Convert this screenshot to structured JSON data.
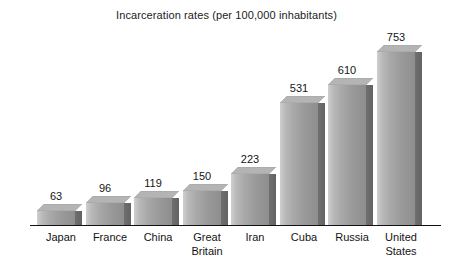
{
  "chart_data": {
    "type": "bar",
    "title": "Incarceration rates (per 100,000 inhabitants)",
    "xlabel": "",
    "ylabel": "",
    "ylim": [
      0,
      800
    ],
    "grid": false,
    "legend": "none",
    "value_labels": true,
    "style": "3d-grayscale-bars",
    "categories": [
      "Japan",
      "France",
      "China",
      "Great Britain",
      "Iran",
      "Cuba",
      "Russia",
      "United States"
    ],
    "values": [
      63,
      96,
      119,
      150,
      223,
      531,
      610,
      753
    ],
    "bars": [
      {
        "label": "Japan",
        "label_lines": [
          "Japan"
        ],
        "value": 63,
        "value_text": "63"
      },
      {
        "label": "France",
        "label_lines": [
          "France"
        ],
        "value": 96,
        "value_text": "96"
      },
      {
        "label": "China",
        "label_lines": [
          "China"
        ],
        "value": 119,
        "value_text": "119"
      },
      {
        "label": "Great Britain",
        "label_lines": [
          "Great",
          "Britain"
        ],
        "value": 150,
        "value_text": "150"
      },
      {
        "label": "Iran",
        "label_lines": [
          "Iran"
        ],
        "value": 223,
        "value_text": "223"
      },
      {
        "label": "Cuba",
        "label_lines": [
          "Cuba"
        ],
        "value": 531,
        "value_text": "531"
      },
      {
        "label": "Russia",
        "label_lines": [
          "Russia"
        ],
        "value": 610,
        "value_text": "610"
      },
      {
        "label": "United States",
        "label_lines": [
          "United",
          "States"
        ],
        "value": 753,
        "value_text": "753"
      }
    ],
    "colors": {
      "background": "#ffffff",
      "axis": "#111111",
      "bar_face_light": "#cfcfcf",
      "bar_face_dark": "#8e8e8e",
      "bar_side": "#676767",
      "text": "#141414"
    }
  }
}
